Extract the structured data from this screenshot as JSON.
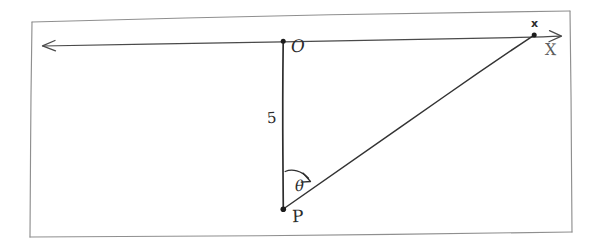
{
  "figure": {
    "kind": "hand-drawn-geometry-sketch",
    "background_color": "#ffffff",
    "ink_color": "#2e2e2e",
    "frame_color": "#8f8f8f"
  },
  "labels": {
    "origin": "O",
    "point_p": "P",
    "segment_length": "5",
    "angle": "θ",
    "point_x": "x",
    "axis_x": "X"
  },
  "geometry": {
    "points": {
      "O": {
        "x": 283,
        "y": 41
      },
      "P": {
        "x": 283,
        "y": 209
      },
      "x": {
        "x": 534,
        "y": 35
      }
    },
    "vertical_segment": {
      "from": "O",
      "to": "P",
      "length_label": "5"
    },
    "ray_from_p": {
      "from": "P",
      "to": "x"
    },
    "horizontal_axis": {
      "left_arrow_x": 43,
      "right_arrow_x": 561,
      "y_left": 46,
      "y_right": 36
    },
    "angle_arc": {
      "vertex": "P",
      "label": "θ",
      "measured_from": "PO",
      "measured_to": "Px",
      "direction": "clockwise"
    }
  },
  "frame": {
    "top_left": {
      "x": 32,
      "y": 22
    },
    "top_right": {
      "x": 570,
      "y": 11
    },
    "bottom_right": {
      "x": 572,
      "y": 232
    },
    "bottom_left": {
      "x": 30,
      "y": 237
    }
  }
}
